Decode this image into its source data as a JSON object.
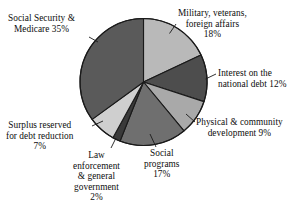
{
  "figure": {
    "background_color": "#ffffff",
    "text_color": "#0d0d0d",
    "outline_color": "#1a1a1a"
  },
  "chart_data": {
    "type": "pie",
    "title": "",
    "subtitle": "",
    "xlabel": "",
    "ylabel": "",
    "legend_position": "callout-labels",
    "grid": false,
    "units": "percent",
    "total": 100,
    "start_angle_deg": 0,
    "direction": "clockwise",
    "categories": [
      "Military, veterans, foreign affairs",
      "Interest on the national debt",
      "Physical & community development",
      "Social programs",
      "Law enforcement & general government",
      "Surplus reserved for debt reduction",
      "Social Security & Medicare"
    ],
    "values": [
      18,
      12,
      9,
      17,
      2,
      7,
      35
    ],
    "slice_colors": [
      "#b9b9b9",
      "#4d4d4d",
      "#a9a9a9",
      "#6f6f6f",
      "#3a3a3a",
      "#cfcfcf",
      "#5a5a5a"
    ],
    "slices": [
      {
        "label": "Military, veterans, foreign affairs",
        "value": 18,
        "color": "#b9b9b9"
      },
      {
        "label": "Interest on the national debt",
        "value": 12,
        "color": "#4d4d4d"
      },
      {
        "label": "Physical & community development",
        "value": 9,
        "color": "#a9a9a9"
      },
      {
        "label": "Social programs",
        "value": 17,
        "color": "#6f6f6f"
      },
      {
        "label": "Law enforcement & general government",
        "value": 2,
        "color": "#3a3a3a"
      },
      {
        "label": "Surplus reserved for debt reduction",
        "value": 7,
        "color": "#cfcfcf"
      },
      {
        "label": "Social Security & Medicare",
        "value": 35,
        "color": "#5a5a5a"
      }
    ]
  },
  "callouts": {
    "military": {
      "line1": "Military, veterans,",
      "line2": "foreign affairs",
      "line3": "18%"
    },
    "interest": {
      "line1": "Interest on the",
      "line2": "national debt  12%"
    },
    "physical": {
      "line1": "Physical & community",
      "line2": "development  9%"
    },
    "social_programs": {
      "line1": "Social",
      "line2": "programs",
      "line3": "17%"
    },
    "law_enforcement": {
      "line1": "Law",
      "line2": "enforcement",
      "line3": "& general",
      "line4": "government",
      "line5": "2%"
    },
    "surplus": {
      "line1": "Surplus reserved",
      "line2": "for debt reduction",
      "line3": "7%"
    },
    "social_security": {
      "line1": "Social Security &",
      "line2": "Medicare  35%"
    }
  }
}
